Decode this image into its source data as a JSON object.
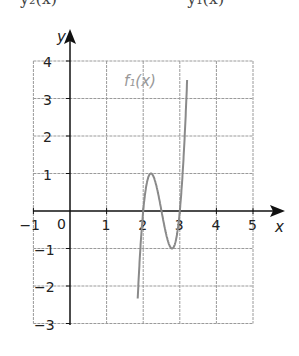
{
  "header": {
    "clipped_left": "y₂(x)",
    "clipped_right": "y₁(x)"
  },
  "colors": {
    "grid": "#9a9a9a",
    "curve": "#8a8a8a",
    "axes": "#111111",
    "label": "#999999"
  },
  "chart_data": {
    "type": "line",
    "title": "",
    "xlabel": "x",
    "ylabel": "y",
    "xlim": [
      -1,
      5
    ],
    "ylim": [
      -3,
      4
    ],
    "grid": true,
    "x_ticks": [
      "-1",
      "1",
      "2",
      "3",
      "4",
      "5"
    ],
    "y_ticks": [
      "4",
      "3",
      "2",
      "1",
      "-1",
      "-2",
      "-3"
    ],
    "origin_label": "0",
    "series": [
      {
        "name": "f₁(x)",
        "formula": "≈20.8(x-2)(x-2.5)(x-3)",
        "x": [
          1.87,
          1.95,
          2.0,
          2.1,
          2.21,
          2.3,
          2.4,
          2.5,
          2.6,
          2.7,
          2.79,
          2.9,
          3.0,
          3.1,
          3.17
        ],
        "y": [
          -3.0,
          -1.3,
          0.0,
          0.83,
          1.0,
          0.83,
          0.42,
          0.0,
          -0.42,
          -0.83,
          -1.0,
          -0.83,
          0.0,
          1.7,
          4.0
        ]
      }
    ],
    "annotations": [
      {
        "text": "f₁(x)",
        "x": 2.5,
        "y": 3.3
      }
    ]
  }
}
